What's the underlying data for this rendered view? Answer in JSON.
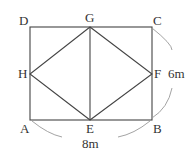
{
  "diagram": {
    "points": {
      "A": "A",
      "B": "B",
      "C": "C",
      "D": "D",
      "E": "E",
      "F": "F",
      "G": "G",
      "H": "H"
    },
    "dimensions": {
      "width": "8m",
      "height": "6m"
    }
  }
}
